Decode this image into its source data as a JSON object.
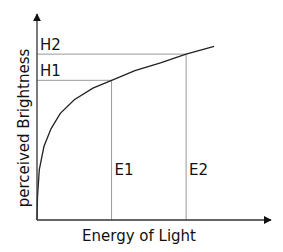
{
  "chart_data": {
    "type": "line",
    "title": "",
    "xlabel": "Energy of Light",
    "ylabel": "perceived Brightness",
    "grid": false,
    "legend": "none",
    "xlim": [
      0,
      1
    ],
    "ylim": [
      0,
      1
    ],
    "curve": {
      "name": "perceived brightness vs energy",
      "shape": "logarithmic",
      "x": [
        0,
        0.002,
        0.01,
        0.03,
        0.06,
        0.1,
        0.16,
        0.24,
        0.32,
        0.42,
        0.53,
        0.64,
        0.76
      ],
      "y": [
        0,
        0.12,
        0.26,
        0.38,
        0.47,
        0.55,
        0.62,
        0.68,
        0.72,
        0.77,
        0.81,
        0.855,
        0.895
      ]
    },
    "markers": [
      {
        "x_label": "E1",
        "y_label": "H1",
        "x": 0.32,
        "y": 0.72
      },
      {
        "x_label": "E2",
        "y_label": "H2",
        "x": 0.64,
        "y": 0.855
      }
    ]
  }
}
